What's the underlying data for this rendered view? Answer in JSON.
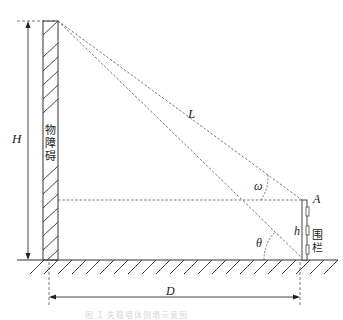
{
  "diagram": {
    "labels": {
      "H": "H",
      "L": "L",
      "omega": "ω",
      "A": "A",
      "h": "h",
      "theta": "θ",
      "D": "D"
    },
    "wall_text": [
      "物",
      "障",
      "碍"
    ],
    "fence_text": [
      "围",
      "栏"
    ],
    "caption": "图 1   失稳墙体倒塌示意图",
    "colors": {
      "line": "#333333",
      "dashed": "#555555",
      "background": "#ffffff"
    }
  }
}
